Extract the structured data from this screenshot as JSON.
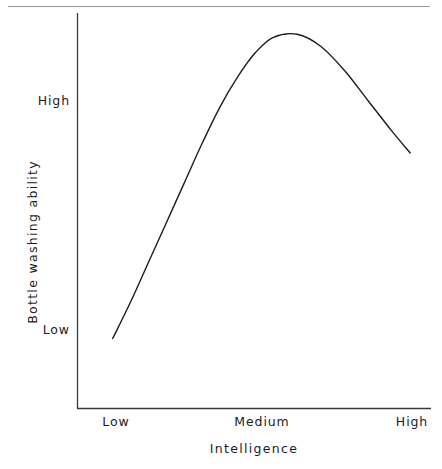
{
  "figure": {
    "background_color": "#ffffff",
    "ink_color": "#1c1c1c",
    "separator_color": "#9a9a9a",
    "has_top_separator_rule": true
  },
  "chart_data": {
    "type": "line",
    "title": "",
    "subtitle": "",
    "xlabel": "Intelligence",
    "ylabel": "Bottle washing ability",
    "x_tick_labels": [
      "Low",
      "Medium",
      "High"
    ],
    "y_tick_labels": [
      "Low",
      "High"
    ],
    "x_tick_values": [
      0.0,
      0.5,
      1.0
    ],
    "y_tick_values": [
      0.0,
      1.0
    ],
    "xlim": [
      -0.12,
      1.07
    ],
    "ylim": [
      -0.23,
      1.07
    ],
    "grid": false,
    "legend": null,
    "legend_position": "none",
    "series": [
      {
        "name": "Bottle washing ability",
        "line_color": "#1c1c1c",
        "line_width": 1.4,
        "marker": "none",
        "x": [
          0.0,
          0.06,
          0.12,
          0.18,
          0.24,
          0.3,
          0.36,
          0.42,
          0.48,
          0.54,
          0.62,
          0.7,
          0.78,
          0.86,
          0.94,
          1.0
        ],
        "y": [
          0.0,
          0.12,
          0.25,
          0.38,
          0.51,
          0.64,
          0.76,
          0.86,
          0.94,
          0.99,
          1.0,
          0.96,
          0.88,
          0.78,
          0.68,
          0.61
        ]
      }
    ],
    "annotations": [
      {
        "text": "peak",
        "x": 0.6,
        "y": 1.0,
        "description": "curve maximum near Medium intelligence"
      }
    ],
    "shape_description": "Inverted-U (concave) curve: bottle washing ability rises steeply from Low at low intelligence, peaks just past Medium intelligence, then declines toward High intelligence."
  },
  "axes": {
    "x_axis_label": "Intelligence",
    "y_axis_label": "Bottle washing ability",
    "x_ticks": [
      {
        "label": "Low"
      },
      {
        "label": "Medium"
      },
      {
        "label": "High"
      }
    ],
    "y_ticks": [
      {
        "label": "High"
      },
      {
        "label": "Low"
      }
    ]
  }
}
